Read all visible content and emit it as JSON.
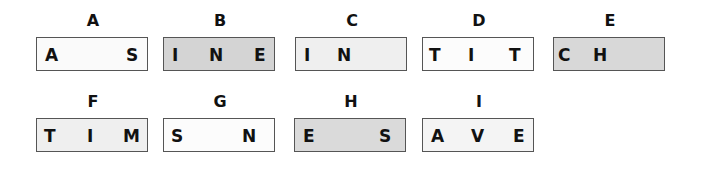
{
  "figure": {
    "items": [
      {
        "label": "A",
        "fill": "#fafafa",
        "x": 36,
        "y": 11,
        "letters": [
          {
            "ch": "A",
            "pos": 8
          },
          {
            "ch": "S",
            "pos": 89
          }
        ]
      },
      {
        "label": "B",
        "fill": "#d4d4d4",
        "x": 163,
        "y": 11,
        "letters": [
          {
            "ch": "I",
            "pos": 8
          },
          {
            "ch": "N",
            "pos": 45
          },
          {
            "ch": "E",
            "pos": 90
          }
        ]
      },
      {
        "label": "C",
        "fill": "#efefef",
        "x": 295,
        "y": 11,
        "letters": [
          {
            "ch": "I",
            "pos": 8
          },
          {
            "ch": "N",
            "pos": 41
          }
        ]
      },
      {
        "label": "D",
        "fill": "#fcfcfc",
        "x": 422,
        "y": 11,
        "letters": [
          {
            "ch": "T",
            "pos": 6
          },
          {
            "ch": "I",
            "pos": 45
          },
          {
            "ch": "T",
            "pos": 86
          }
        ]
      },
      {
        "label": "E",
        "fill": "#d8d8d8",
        "x": 553,
        "y": 11,
        "letters": [
          {
            "ch": "C",
            "pos": 4
          },
          {
            "ch": "H",
            "pos": 39
          }
        ]
      },
      {
        "label": "F",
        "fill": "#efefef",
        "x": 36,
        "y": 92,
        "letters": [
          {
            "ch": "T",
            "pos": 7
          },
          {
            "ch": "I",
            "pos": 50
          },
          {
            "ch": "M",
            "pos": 86
          }
        ]
      },
      {
        "label": "G",
        "fill": "#fcfcfc",
        "x": 163,
        "y": 92,
        "letters": [
          {
            "ch": "S",
            "pos": 7
          },
          {
            "ch": "N",
            "pos": 78
          }
        ]
      },
      {
        "label": "H",
        "fill": "#dadada",
        "x": 294,
        "y": 92,
        "letters": [
          {
            "ch": "E",
            "pos": 8
          },
          {
            "ch": "S",
            "pos": 84
          }
        ]
      },
      {
        "label": "I",
        "fill": "#f4f4f4",
        "x": 422,
        "y": 92,
        "letters": [
          {
            "ch": "A",
            "pos": 8
          },
          {
            "ch": "V",
            "pos": 48
          },
          {
            "ch": "E",
            "pos": 90
          }
        ]
      }
    ]
  }
}
